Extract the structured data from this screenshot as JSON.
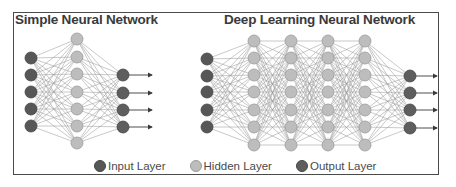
{
  "titles": {
    "simple": "Simple Neural Network",
    "deep": "Deep Learning Neural Network"
  },
  "legend": [
    {
      "label": "Input Layer",
      "color": "#575757",
      "stroke": "#444444"
    },
    {
      "label": "Hidden Layer",
      "color": "#bdbdbd",
      "stroke": "#9a9a9a"
    },
    {
      "label": "Output Layer",
      "color": "#5e5e5e",
      "stroke": "#474747"
    }
  ],
  "colors": {
    "input": "#575757",
    "hidden": "#bdbdbd",
    "output": "#5e5e5e",
    "edge": "#9c9c9c",
    "border": "#4a4a4a",
    "arrow": "#3a3a3a"
  },
  "networks": {
    "simple": {
      "layers": [
        {
          "type": "input",
          "x": 31,
          "y": [
            58,
            75,
            92,
            109,
            126
          ]
        },
        {
          "type": "hidden",
          "x": 77,
          "y": [
            39,
            57,
            74,
            92,
            109,
            126,
            143
          ]
        },
        {
          "type": "output",
          "x": 123,
          "y": [
            75,
            93,
            110,
            127
          ]
        }
      ],
      "arrow_end_x": 152
    },
    "deep": {
      "layers": [
        {
          "type": "input",
          "x": 207,
          "y": [
            59,
            76,
            92,
            110,
            127
          ]
        },
        {
          "type": "hidden",
          "x": 254,
          "y": [
            41,
            58,
            75,
            92,
            110,
            127,
            145
          ]
        },
        {
          "type": "hidden",
          "x": 291,
          "y": [
            41,
            58,
            75,
            92,
            110,
            127,
            145
          ]
        },
        {
          "type": "hidden",
          "x": 328,
          "y": [
            41,
            58,
            75,
            92,
            110,
            127,
            145
          ]
        },
        {
          "type": "hidden",
          "x": 365,
          "y": [
            41,
            58,
            75,
            92,
            110,
            127,
            145
          ]
        },
        {
          "type": "output",
          "x": 410,
          "y": [
            76,
            93,
            110,
            128
          ]
        }
      ],
      "arrow_end_x": 437
    }
  },
  "node_radius": 6
}
